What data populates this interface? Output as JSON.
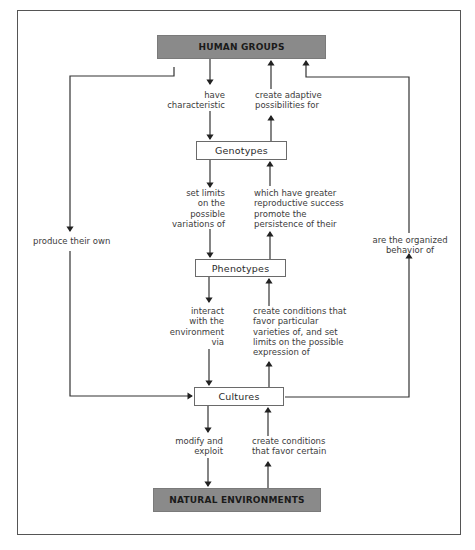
{
  "diagram": {
    "colors": {
      "dark_box": "#8a8a8a",
      "light_box": "#ffffff",
      "line": "#333333",
      "frame": "#555555"
    },
    "nodes": {
      "human_groups": "HUMAN GROUPS",
      "genotypes": "Genotypes",
      "phenotypes": "Phenotypes",
      "cultures": "Cultures",
      "natural_environments": "NATURAL ENVIRONMENTS"
    },
    "edges": {
      "human_to_genotypes": "have\ncharacteristic",
      "genotypes_to_human": "create adaptive\npossibilities for",
      "genotypes_to_phenotypes": "set limits\non the\npossible\nvariations of",
      "phenotypes_to_genotypes": "which have greater\nreproductive success\npromote the\npersistence of their",
      "phenotypes_to_cultures": "interact\nwith the\nenvironment\nvia",
      "cultures_to_phenotypes": "create conditions that\nfavor particular\nvarieties of, and set\nlimits on the possible\nexpression of",
      "cultures_to_environments": "modify and\nexploit",
      "environments_to_cultures": "create conditions\nthat favor certain",
      "human_to_cultures": "produce their own",
      "cultures_to_human": "are the organized\nbehavior of"
    }
  }
}
